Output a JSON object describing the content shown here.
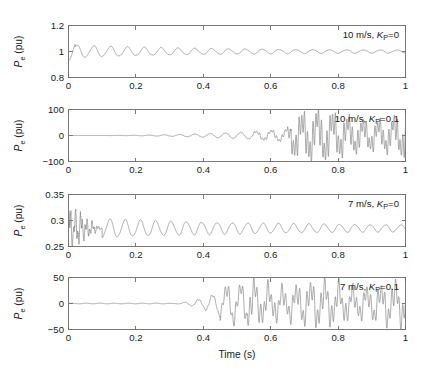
{
  "figure": {
    "xlabel": "Time (s)",
    "ylabel": "P",
    "ylabel_sub": "e",
    "ylabel_unit": " (pu)",
    "x_ticks": [
      "0",
      "0.2",
      "0.4",
      "0.6",
      "0.8",
      "1"
    ],
    "x_tick_values": [
      0,
      0.2,
      0.4,
      0.6,
      0.8,
      1
    ],
    "xlim": [
      0,
      1
    ],
    "line_color": "#7d7d7d",
    "axis_color": "#6b6b6b",
    "background": "#ffffff"
  },
  "chart_data": [
    {
      "type": "line",
      "index": 0,
      "title": "",
      "annotation_wind": "10 m/s, ",
      "annotation_k": "K",
      "annotation_k_sub": "P",
      "annotation_val": "=0",
      "annotation_full": "10 m/s, KP=0",
      "xlabel": "",
      "ylabel": "Pe (pu)",
      "xlim": [
        0,
        1
      ],
      "ylim": [
        0.8,
        1.2
      ],
      "y_ticks": [
        "0.8",
        "1",
        "1.2"
      ],
      "y_tick_values": [
        0.8,
        1,
        1.2
      ],
      "grid": false,
      "legend": "none",
      "description": "Damped oscillation settling to 1.0 pu; initial dip to 0.93, ripple amplitude decaying from 0.05 to 0.008 pu, frequency about 20 Hz",
      "baseline": 1.0,
      "start_value": 0.93,
      "initial_amplitude": 0.05,
      "final_amplitude": 0.008,
      "ripple_freq_hz": 20,
      "damping": 2.6
    },
    {
      "type": "line",
      "index": 1,
      "title": "",
      "annotation_wind": "10 m/s, ",
      "annotation_k": "K",
      "annotation_k_sub": "P",
      "annotation_val": "=0.1",
      "annotation_full": "10 m/s, KP=0.1",
      "xlabel": "",
      "ylabel": "Pe (pu)",
      "xlim": [
        0,
        1
      ],
      "ylim": [
        -100,
        100
      ],
      "y_ticks": [
        "100",
        "0",
        "-100"
      ],
      "y_tick_values": [
        100,
        0,
        -100
      ],
      "grid": false,
      "legend": "none",
      "description": "Unstable growing oscillation about 0; amplitude grows from near 0 to about 60 pu by t=1, with high frequency ripple superimposed after t=0.62",
      "baseline": 0,
      "growth_start": 0.2,
      "final_amplitude": 58,
      "envelope_peak_t": 0.66,
      "envelope_peak_amp": 52,
      "carrier_freq_hz": 22,
      "ripple_freq_hz": 120
    },
    {
      "type": "line",
      "index": 2,
      "title": "",
      "annotation_wind": "7 m/s, ",
      "annotation_k": "K",
      "annotation_k_sub": "P",
      "annotation_val": "=0",
      "annotation_full": "7 m/s, KP=0",
      "xlabel": "",
      "ylabel": "Pe (pu)",
      "xlim": [
        0,
        1
      ],
      "ylim": [
        0.25,
        0.35
      ],
      "y_ticks": [
        "0.25",
        "0.3",
        "0.35"
      ],
      "y_tick_values": [
        0.25,
        0.3,
        0.35
      ],
      "grid": false,
      "legend": "none",
      "description": "Noisy initial transient 0 to 0.1 s oscillating 0.265-0.325, then regular decaying oscillation about 0.285 settling to amplitude 0.004",
      "baseline": 0.285,
      "transient_end": 0.1,
      "transient_amplitude": 0.028,
      "initial_amplitude": 0.018,
      "final_amplitude": 0.004,
      "ripple_freq_hz": 22,
      "damping": 1.9
    },
    {
      "type": "line",
      "index": 3,
      "title": "",
      "annotation_wind": "7 m/s, ",
      "annotation_k": "K",
      "annotation_k_sub": "P",
      "annotation_val": "=0.1",
      "annotation_full": "7 m/s, KP=0.1",
      "xlabel": "Time (s)",
      "ylabel": "Pe (pu)",
      "xlim": [
        0,
        1
      ],
      "ylim": [
        -50,
        50
      ],
      "y_ticks": [
        "50",
        "0",
        "-50"
      ],
      "y_tick_values": [
        50,
        0,
        -50
      ],
      "grid": false,
      "legend": "none",
      "description": "Flat near 0 until t=0.3, then growing oscillation peaking near 32 at t=0.48, then sustained irregular oscillation amplitude 25-30 with high frequency ripple",
      "baseline": 0,
      "growth_start": 0.3,
      "envelope_peak_t": 0.48,
      "envelope_peak_amp": 32,
      "sustained_amplitude": 27,
      "carrier_freq_hz": 24,
      "ripple_freq_hz": 95
    }
  ]
}
